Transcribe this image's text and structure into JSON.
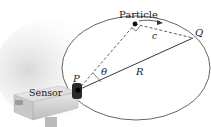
{
  "diagram": {
    "labels": {
      "particle": "Particle",
      "q": "Q",
      "c": "c",
      "theta": "θ",
      "r": "R",
      "p": "P",
      "sensor": "Sensor"
    },
    "colors": {
      "ring": "#555555",
      "lines": "#333333",
      "sensor_body": "#e4e4e4",
      "dot": "#111111"
    }
  }
}
